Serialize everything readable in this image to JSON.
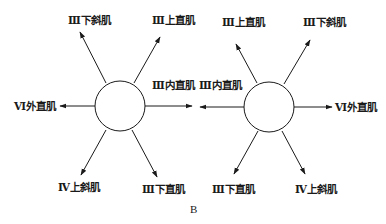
{
  "figure_label": "B",
  "diagrams": [
    {
      "name": "left-eye",
      "muscles": [
        {
          "key": "up_left",
          "label": "Ⅲ下斜肌"
        },
        {
          "key": "up_right",
          "label": "Ⅲ上直肌"
        },
        {
          "key": "right",
          "label": "Ⅲ内直肌"
        },
        {
          "key": "left",
          "label": "Ⅵ外直肌"
        },
        {
          "key": "down_left",
          "label": "Ⅳ上斜肌"
        },
        {
          "key": "down_right",
          "label": "Ⅲ下直肌"
        }
      ]
    },
    {
      "name": "right-eye",
      "muscles": [
        {
          "key": "up_left",
          "label": "Ⅲ上直肌"
        },
        {
          "key": "up_right",
          "label": "Ⅲ下斜肌"
        },
        {
          "key": "left",
          "label": "Ⅲ内直肌"
        },
        {
          "key": "right",
          "label": "Ⅵ外直肌"
        },
        {
          "key": "down_left",
          "label": "Ⅲ下直肌"
        },
        {
          "key": "down_right",
          "label": "Ⅳ上斜肌"
        }
      ]
    }
  ]
}
